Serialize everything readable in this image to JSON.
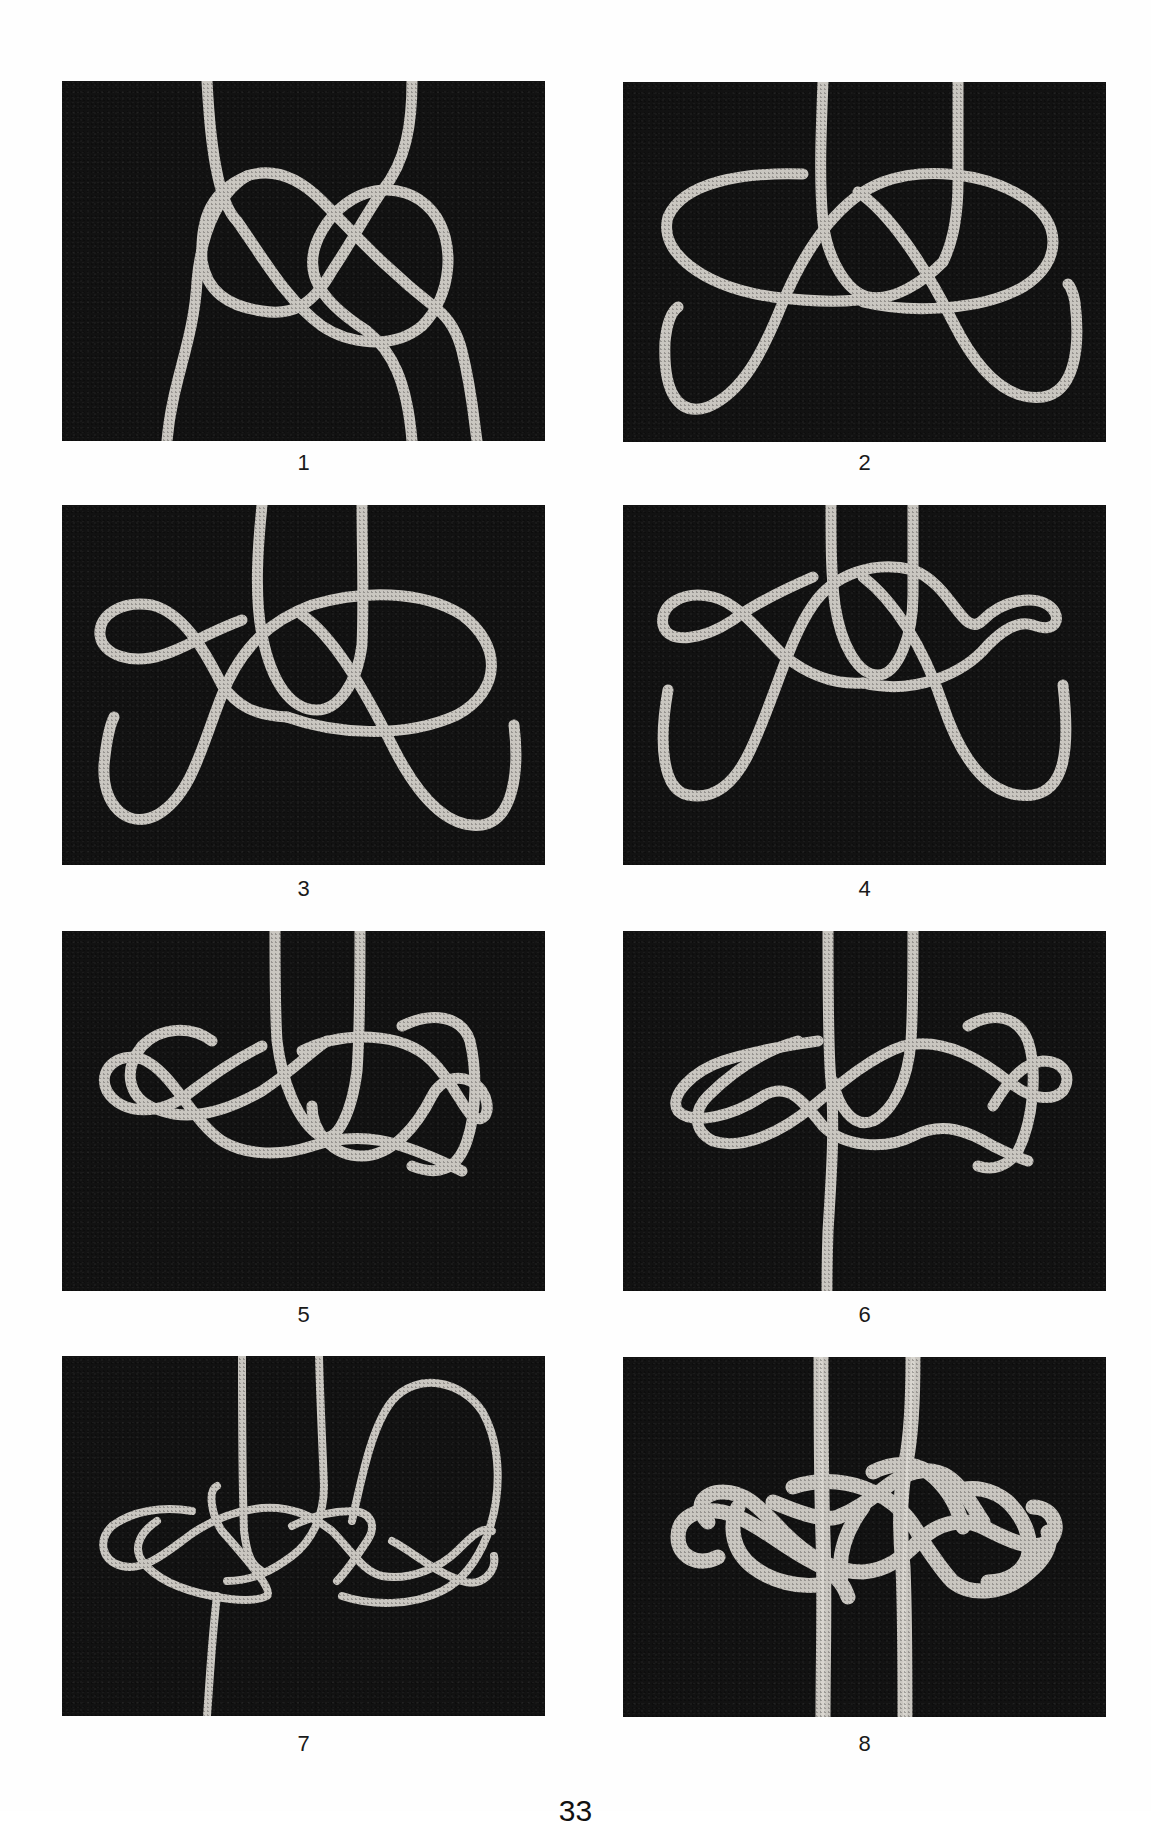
{
  "page": {
    "background": "#fefefe",
    "photo_background": "#121212",
    "rope_color": "#c9c6c0",
    "page_number": "33"
  },
  "figures": [
    {
      "id": 1,
      "label": "1"
    },
    {
      "id": 2,
      "label": "2"
    },
    {
      "id": 3,
      "label": "3"
    },
    {
      "id": 4,
      "label": "4"
    },
    {
      "id": 5,
      "label": "5"
    },
    {
      "id": 6,
      "label": "6"
    },
    {
      "id": 7,
      "label": "7"
    },
    {
      "id": 8,
      "label": "8"
    }
  ]
}
